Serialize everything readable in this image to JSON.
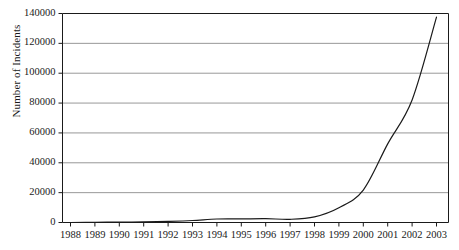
{
  "chart_data": {
    "type": "line",
    "title": "",
    "xlabel": "",
    "ylabel": "Number of Incidents",
    "x": [
      1988,
      1989,
      1990,
      1991,
      1992,
      1993,
      1994,
      1995,
      1996,
      1997,
      1998,
      1999,
      2000,
      2001,
      2002,
      2003
    ],
    "values": [
      6,
      132,
      252,
      406,
      773,
      1334,
      2340,
      2412,
      2573,
      2134,
      3734,
      9859,
      21756,
      52658,
      82094,
      137529
    ],
    "categories": [
      "1988",
      "1989",
      "1990",
      "1991",
      "1992",
      "1993",
      "1994",
      "1995",
      "1996",
      "1997",
      "1998",
      "1999",
      "2000",
      "2001",
      "2002",
      "2003"
    ],
    "xtick_labels": [
      "1988",
      "1989",
      "1990",
      "1991",
      "1992",
      "1993",
      "1994",
      "1995",
      "1996",
      "1997",
      "1998",
      "1999",
      "2000",
      "2001",
      "2002",
      "2003"
    ],
    "ytick_labels": [
      "0",
      "20000",
      "40000",
      "60000",
      "80000",
      "100000",
      "120000",
      "140000"
    ],
    "ytick_values": [
      0,
      20000,
      40000,
      60000,
      80000,
      100000,
      120000,
      140000
    ],
    "ylim": [
      0,
      140000
    ],
    "xlim": [
      1988,
      2003
    ],
    "grid": "horizontal",
    "legend": "none",
    "series": [
      {
        "name": "Number of Incidents",
        "values": [
          6,
          132,
          252,
          406,
          773,
          1334,
          2340,
          2412,
          2573,
          2134,
          3734,
          9859,
          21756,
          52658,
          82094,
          137529
        ]
      }
    ],
    "colors": {
      "background": "#ffffff",
      "line": "#1a1a1a",
      "grid": "#8c8c8c",
      "axis": "#1a1a1a",
      "text": "#1a1a1a"
    }
  }
}
